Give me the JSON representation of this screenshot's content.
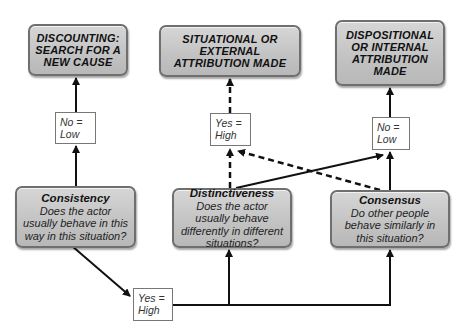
{
  "outcomes": {
    "discounting": "DISCOUNTING: SEARCH FOR A NEW CAUSE",
    "situational": "SITUATIONAL OR EXTERNAL ATTRIBUTION MADE",
    "dispositional": "DISPOSITIONAL OR INTERNAL ATTRIBUTION MADE"
  },
  "questions": {
    "consistency": {
      "title": "Consistency",
      "question": "Does the actor usually behave in this way in this situation?"
    },
    "distinctiveness": {
      "title": "Distinctiveness",
      "question": "Does the actor usually behave differently in different situations?"
    },
    "consensus": {
      "title": "Consensus",
      "question": "Do other people behave similarly in this situation?"
    }
  },
  "labels": {
    "left_no": {
      "line1": "No =",
      "line2": "Low"
    },
    "middle_yes": {
      "line1": "Yes =",
      "line2": "High"
    },
    "right_no": {
      "line1": "No =",
      "line2": "Low"
    },
    "bottom_yes": {
      "line1": "Yes =",
      "line2": "High"
    }
  },
  "colors": {
    "node_fill": "#c6c6c6",
    "node_border": "#6f6f6f",
    "line": "#111111"
  }
}
